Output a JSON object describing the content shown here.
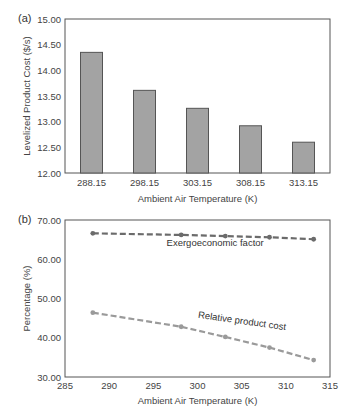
{
  "chart_data": [
    {
      "panel": "(a)",
      "type": "bar",
      "title": "",
      "xlabel": "Ambient Air Temperature (K)",
      "ylabel": "Levelized Product Cost ($/s)",
      "categories": [
        "288.15",
        "298.15",
        "303.15",
        "308.15",
        "313.15"
      ],
      "values": [
        14.35,
        13.61,
        13.26,
        12.92,
        12.6
      ],
      "ylim": [
        12.0,
        15.0
      ],
      "yticks": [
        "12.00",
        "12.50",
        "13.00",
        "13.50",
        "14.00",
        "14.50",
        "15.00"
      ],
      "grid": false,
      "legend": null,
      "colors": {
        "bar_fill": "#a3a3a3",
        "bar_stroke": "#555555",
        "axis": "#555555"
      }
    },
    {
      "panel": "(b)",
      "type": "line",
      "title": "",
      "xlabel": "Ambient Air Temperature (K)",
      "ylabel": "Percentage (%)",
      "x": [
        288.15,
        298.15,
        303.15,
        308.15,
        313.15
      ],
      "series": [
        {
          "name": "Exergoeconomic factor",
          "values": [
            66.6,
            66.2,
            65.9,
            65.6,
            65.1
          ],
          "color": "#6b6b6b",
          "style": "dashed",
          "marker": "circle"
        },
        {
          "name": "Relative product cost",
          "values": [
            46.4,
            42.8,
            40.2,
            37.5,
            34.3
          ],
          "color": "#9a9a9a",
          "style": "dashed",
          "marker": "circle"
        }
      ],
      "xlim": [
        285,
        315
      ],
      "ylim": [
        30.0,
        70.0
      ],
      "xticks": [
        "285",
        "290",
        "295",
        "300",
        "305",
        "310",
        "315"
      ],
      "yticks": [
        "30.00",
        "40.00",
        "50.00",
        "60.00",
        "70.00"
      ],
      "annotations": [
        {
          "text": "Exergoeconomic factor",
          "x": 302,
          "y": 63.5,
          "rotation": 0
        },
        {
          "text": "Relative product cost",
          "x": 305,
          "y": 43.5,
          "rotation": 8
        }
      ],
      "grid": false,
      "legend": null
    }
  ],
  "labels": {
    "panel_a": "(a)",
    "panel_b": "(b)"
  }
}
